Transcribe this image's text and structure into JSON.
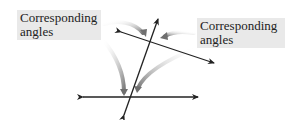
{
  "diagram": {
    "labels": {
      "left": {
        "line1": "Corresponding",
        "line2": "angles"
      },
      "right": {
        "line1": "Corresponding",
        "line2": "angles"
      }
    },
    "colors": {
      "line": "#222222",
      "callout_arrow": "#9a9a9a",
      "label_bg": "#e9e9e9"
    }
  }
}
